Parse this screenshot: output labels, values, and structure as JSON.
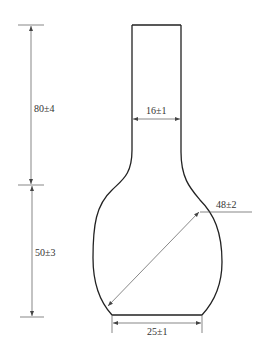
{
  "drawing": {
    "type": "technical-drawing",
    "subject": "flask outline with dimensions",
    "dimensions": {
      "neck_height": "80±4",
      "bulb_height": "50±3",
      "neck_width": "16±1",
      "bulb_diameter": "48±2",
      "base_width": "25±1"
    },
    "colors": {
      "outline": "#222222",
      "dimension_line": "#555555",
      "text": "#333333"
    }
  }
}
